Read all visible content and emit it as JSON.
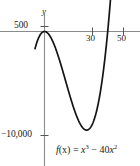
{
  "figure": {
    "kind": "function-graph",
    "width": 140,
    "height": 166,
    "background_color": "#ffffff"
  },
  "axes": {
    "y_axis_label": "y",
    "axis_color": "#8a8a8a",
    "x_tick_labels": [
      "30",
      "50"
    ],
    "x_tick_values": [
      30,
      50
    ],
    "y_tick_labels": [
      "500",
      "-10,000"
    ],
    "y_tick_values": [
      500,
      -10000
    ],
    "y_tick_label_top": "500",
    "y_tick_label_bottom": "−10,000"
  },
  "annotation": {
    "formula_plain": "f(x) = x³ − 40x²",
    "formula_lhs": "f",
    "formula_arg": "(x)",
    "formula_eq": " = ",
    "formula_term1_base": "x",
    "formula_term1_exp": "3",
    "formula_operator": " − ",
    "formula_coefficient": "40",
    "formula_term2_base": "x",
    "formula_term2_exp": "2",
    "text_color": "#1a1a1a"
  },
  "chart_data": {
    "type": "line",
    "title": "",
    "subtitle": "",
    "xlabel": "",
    "ylabel": "y",
    "annotation": "f(x) = x³ − 40x²",
    "function": "x^3 - 40*x^2",
    "curve_color": "#111111",
    "grid": false,
    "legend": false,
    "xlim": [
      -6,
      54
    ],
    "ylim": [
      -13500,
      1900
    ],
    "xticks": [
      30,
      50
    ],
    "xtick_labels": [
      "30",
      "50"
    ],
    "yticks": [
      500,
      -10000
    ],
    "ytick_labels": [
      "500",
      "-10,000"
    ],
    "x_axis_at_y": 0,
    "y_axis_at_x": 0,
    "features": {
      "local_maximum": {
        "x": 0,
        "y": 0
      },
      "local_minimum": {
        "x": 26.67,
        "y": -9481
      },
      "roots": [
        0,
        40
      ],
      "inflection": {
        "x": 13.33,
        "y": -4741
      }
    },
    "series": [
      {
        "name": "f(x) = x³ − 40x²",
        "x": [
          -6,
          -5,
          -4,
          -3,
          -2,
          -1,
          0,
          2,
          4,
          6,
          8,
          10,
          12,
          14,
          16,
          18,
          20,
          22,
          24,
          26,
          26.67,
          28,
          30,
          32,
          34,
          36,
          38,
          40,
          42,
          44,
          46,
          47
        ],
        "y": [
          -1656,
          -1125,
          -704,
          -387,
          -168,
          -41,
          0,
          -152,
          -576,
          -1224,
          -2048,
          -3000,
          -4032,
          -5096,
          -6144,
          -7128,
          -8000,
          -8712,
          -9216,
          -9464,
          -9481,
          -9408,
          -9000,
          -8192,
          -6936,
          -5184,
          -2888,
          0,
          3528,
          7744,
          12696,
          15463
        ]
      }
    ]
  }
}
